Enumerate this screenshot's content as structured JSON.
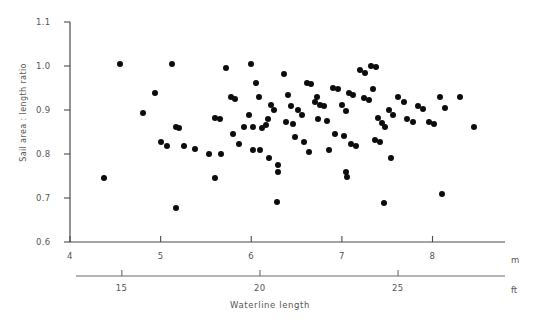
{
  "chart_data": {
    "type": "scatter",
    "title": "",
    "xlabel": "Waterline length",
    "ylabel": "Sail area : length ratio",
    "x_unit_primary": "m",
    "x_unit_secondary": "ft",
    "xlim": [
      4,
      8.8
    ],
    "ylim": [
      0.6,
      1.1
    ],
    "grid": false,
    "legend": null,
    "x_ticks_m": [
      "4",
      "5",
      "6",
      "7",
      "8"
    ],
    "x_ticks_m_values": [
      4,
      5,
      6,
      7,
      8
    ],
    "x_ticks_ft": [
      "15",
      "20",
      "25"
    ],
    "x_ticks_ft_values": [
      15,
      20,
      25
    ],
    "y_ticks": [
      "0.6",
      "0.7",
      "0.8",
      "0.9",
      "1.0",
      "1.1"
    ],
    "y_tick_values": [
      0.6,
      0.7,
      0.8,
      0.9,
      1.0,
      1.1
    ],
    "marker_color": "#0d0d0d",
    "points": [
      [
        4.55,
        1.005
      ],
      [
        4.38,
        0.745
      ],
      [
        4.94,
        0.938
      ],
      [
        4.8,
        0.893
      ],
      [
        5.13,
        1.005
      ],
      [
        5.0,
        0.828
      ],
      [
        5.07,
        0.818
      ],
      [
        5.17,
        0.862
      ],
      [
        5.2,
        0.858
      ],
      [
        5.26,
        0.818
      ],
      [
        5.38,
        0.812
      ],
      [
        5.17,
        0.678
      ],
      [
        5.53,
        0.8
      ],
      [
        5.67,
        0.8
      ],
      [
        5.72,
        0.995
      ],
      [
        5.6,
        0.882
      ],
      [
        5.66,
        0.88
      ],
      [
        5.78,
        0.93
      ],
      [
        5.82,
        0.925
      ],
      [
        5.8,
        0.845
      ],
      [
        5.86,
        0.823
      ],
      [
        5.6,
        0.745
      ],
      [
        6.0,
        1.005
      ],
      [
        6.05,
        0.962
      ],
      [
        5.98,
        0.888
      ],
      [
        6.08,
        0.93
      ],
      [
        6.02,
        0.862
      ],
      [
        6.12,
        0.858
      ],
      [
        6.18,
        0.88
      ],
      [
        6.16,
        0.865
      ],
      [
        6.22,
        0.912
      ],
      [
        6.25,
        0.9
      ],
      [
        6.02,
        0.81
      ],
      [
        6.1,
        0.808
      ],
      [
        6.2,
        0.792
      ],
      [
        6.3,
        0.775
      ],
      [
        6.3,
        0.76
      ],
      [
        6.36,
        0.982
      ],
      [
        6.4,
        0.935
      ],
      [
        6.44,
        0.908
      ],
      [
        6.38,
        0.872
      ],
      [
        6.46,
        0.868
      ],
      [
        6.52,
        0.9
      ],
      [
        6.56,
        0.888
      ],
      [
        6.48,
        0.838
      ],
      [
        6.58,
        0.828
      ],
      [
        6.62,
        0.962
      ],
      [
        6.66,
        0.96
      ],
      [
        6.72,
        0.93
      ],
      [
        6.7,
        0.918
      ],
      [
        6.76,
        0.912
      ],
      [
        6.8,
        0.908
      ],
      [
        6.74,
        0.88
      ],
      [
        6.84,
        0.875
      ],
      [
        6.9,
        0.95
      ],
      [
        6.96,
        0.948
      ],
      [
        7.0,
        0.912
      ],
      [
        7.04,
        0.898
      ],
      [
        7.08,
        0.938
      ],
      [
        7.12,
        0.935
      ],
      [
        6.92,
        0.845
      ],
      [
        7.02,
        0.84
      ],
      [
        7.1,
        0.822
      ],
      [
        7.16,
        0.818
      ],
      [
        7.2,
        0.99
      ],
      [
        7.26,
        0.985
      ],
      [
        7.24,
        0.928
      ],
      [
        7.3,
        0.922
      ],
      [
        7.32,
        1.0
      ],
      [
        7.38,
        0.998
      ],
      [
        7.34,
        0.948
      ],
      [
        7.4,
        0.882
      ],
      [
        7.44,
        0.87
      ],
      [
        7.36,
        0.832
      ],
      [
        7.42,
        0.828
      ],
      [
        7.48,
        0.862
      ],
      [
        7.52,
        0.9
      ],
      [
        7.56,
        0.888
      ],
      [
        7.46,
        0.688
      ],
      [
        7.62,
        0.93
      ],
      [
        7.68,
        0.918
      ],
      [
        7.72,
        0.88
      ],
      [
        7.78,
        0.872
      ],
      [
        7.84,
        0.908
      ],
      [
        7.9,
        0.902
      ],
      [
        7.96,
        0.872
      ],
      [
        8.02,
        0.868
      ],
      [
        8.08,
        0.93
      ],
      [
        8.14,
        0.905
      ],
      [
        8.1,
        0.708
      ],
      [
        8.3,
        0.93
      ],
      [
        8.46,
        0.862
      ],
      [
        6.64,
        0.805
      ],
      [
        7.04,
        0.76
      ],
      [
        7.06,
        0.748
      ],
      [
        5.92,
        0.862
      ],
      [
        6.86,
        0.808
      ],
      [
        7.54,
        0.79
      ],
      [
        6.28,
        0.69
      ]
    ]
  }
}
